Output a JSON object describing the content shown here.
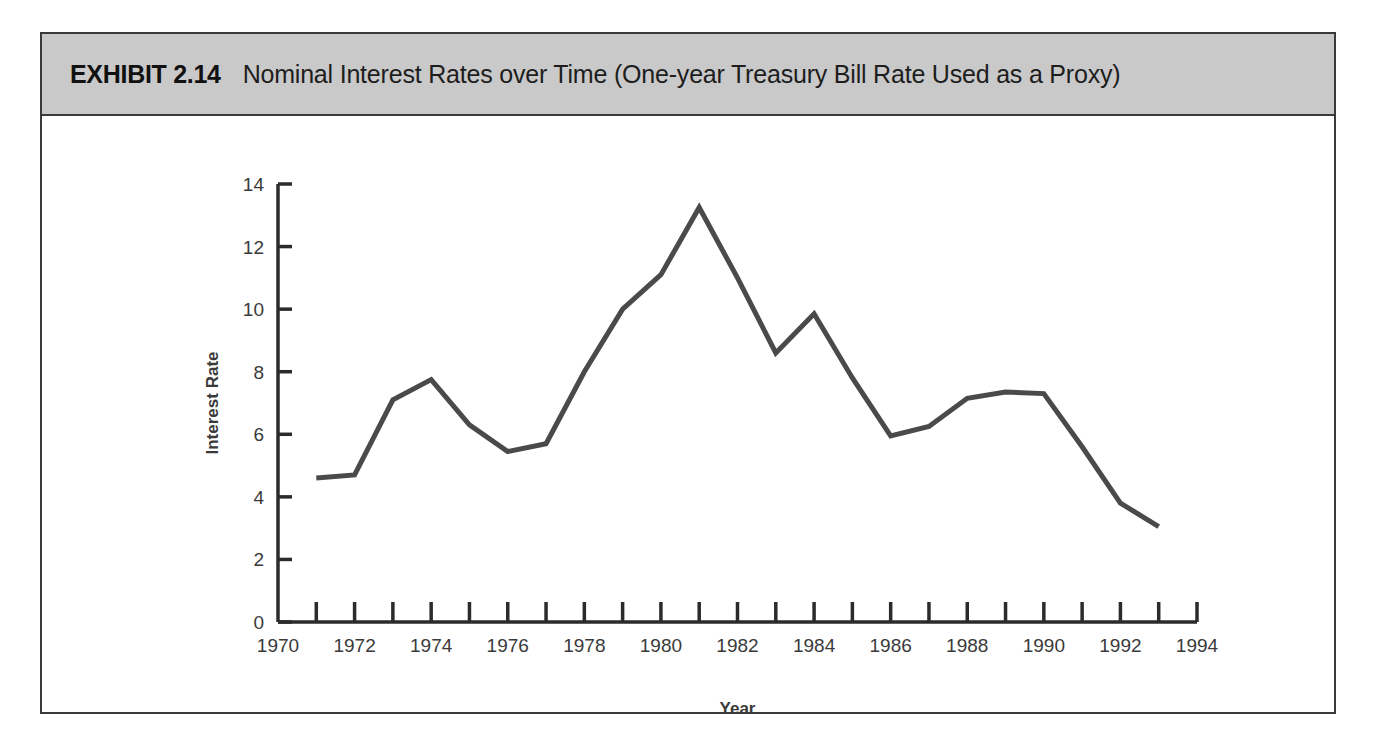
{
  "exhibit": {
    "label": "EXHIBIT 2.14",
    "title": "Nominal Interest Rates over Time (One-year Treasury Bill Rate Used as a Proxy)",
    "header_bg": "#c9c9c9",
    "frame_border_color": "#3a3a3a"
  },
  "chart_data": {
    "type": "line",
    "title": "Nominal Interest Rates over Time (One-year Treasury Bill Rate Used as a Proxy)",
    "xlabel": "Year",
    "ylabel": "Interest Rate",
    "xlim": [
      1970,
      1994
    ],
    "ylim": [
      0,
      14
    ],
    "x_tick_step": 1,
    "x_label_step": 2,
    "y_tick_step": 2,
    "grid": false,
    "legend": false,
    "line_color": "#4a4a4a",
    "line_width": 5,
    "x_tick_labels": [
      "1970",
      "1972",
      "1974",
      "1976",
      "1978",
      "1980",
      "1982",
      "1984",
      "1986",
      "1988",
      "1990",
      "1992",
      "1994"
    ],
    "y_tick_labels": [
      "0",
      "2",
      "4",
      "6",
      "8",
      "10",
      "12",
      "14"
    ],
    "x": [
      1971,
      1972,
      1973,
      1974,
      1975,
      1976,
      1977,
      1978,
      1979,
      1980,
      1981,
      1982,
      1983,
      1984,
      1985,
      1986,
      1987,
      1988,
      1989,
      1990,
      1991,
      1992,
      1993
    ],
    "series": [
      {
        "name": "One-year Treasury Bill Rate",
        "values": [
          4.6,
          4.7,
          7.1,
          7.75,
          6.3,
          5.45,
          5.7,
          8.0,
          10.0,
          11.1,
          13.25,
          11.0,
          8.6,
          9.85,
          7.8,
          5.95,
          6.25,
          7.15,
          7.35,
          7.3,
          5.6,
          3.8,
          3.05
        ]
      }
    ]
  }
}
